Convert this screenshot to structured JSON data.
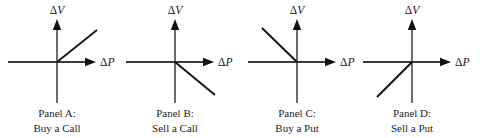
{
  "figure": {
    "name": "option-position-sensitivity-panels",
    "background_color": "#ffffff",
    "line_color": "#111111",
    "axis_color": "#3a3a3a",
    "vertical_axis_color": "#6e6e6e",
    "text_color": "#242424",
    "axes": {
      "y_label_delta": "Δ",
      "y_label_var": "V",
      "x_label_delta": "Δ",
      "x_label_var": "P"
    },
    "panels": [
      {
        "id": "panel-a",
        "caption_line1": "Panel A:",
        "caption_line2": "Buy a Call",
        "slope_description": "positive slope, upper-right quadrant",
        "origin_x": 57,
        "origin_y": 62,
        "x_axis_start": 8,
        "x_axis_end": 96,
        "y_axis_top": 19,
        "y_axis_bottom": 103,
        "payoff_x1": 57,
        "payoff_y1": 62,
        "payoff_x2": 97,
        "payoff_y2": 30,
        "caption_x": 57,
        "caption_y1": 117,
        "caption_y2": 132,
        "y_label_x": 57,
        "y_label_y": 14,
        "x_label_x": 100,
        "x_label_y": 66
      },
      {
        "id": "panel-b",
        "caption_line1": "Panel B:",
        "caption_line2": "Sell a Call",
        "slope_description": "negative slope, lower-right quadrant",
        "origin_x": 175,
        "origin_y": 62,
        "x_axis_start": 126,
        "x_axis_end": 214,
        "y_axis_top": 19,
        "y_axis_bottom": 103,
        "payoff_x1": 175,
        "payoff_y1": 62,
        "payoff_x2": 215,
        "payoff_y2": 95,
        "caption_x": 175,
        "caption_y1": 117,
        "caption_y2": 132,
        "y_label_x": 175,
        "y_label_y": 14,
        "x_label_x": 218,
        "x_label_y": 66
      },
      {
        "id": "panel-c",
        "caption_line1": "Panel C:",
        "caption_line2": "Buy a Put",
        "slope_description": "negative slope, upper-left quadrant",
        "origin_x": 297,
        "origin_y": 62,
        "x_axis_start": 248,
        "x_axis_end": 336,
        "y_axis_top": 19,
        "y_axis_bottom": 103,
        "payoff_x1": 297,
        "payoff_y1": 62,
        "payoff_x2": 262,
        "payoff_y2": 28,
        "caption_x": 297,
        "caption_y1": 117,
        "caption_y2": 132,
        "y_label_x": 297,
        "y_label_y": 14,
        "x_label_x": 340,
        "x_label_y": 66
      },
      {
        "id": "panel-d",
        "caption_line1": "Panel D:",
        "caption_line2": "Sell a Put",
        "slope_description": "positive slope, lower-left quadrant",
        "origin_x": 412,
        "origin_y": 62,
        "x_axis_start": 363,
        "x_axis_end": 451,
        "y_axis_top": 19,
        "y_axis_bottom": 103,
        "payoff_x1": 412,
        "payoff_y1": 62,
        "payoff_x2": 377,
        "payoff_y2": 97,
        "caption_x": 412,
        "caption_y1": 117,
        "caption_y2": 132,
        "y_label_x": 412,
        "y_label_y": 14,
        "x_label_x": 455,
        "x_label_y": 66
      }
    ]
  }
}
